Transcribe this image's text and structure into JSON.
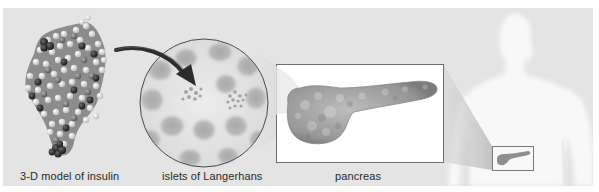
{
  "figure": {
    "labels": {
      "insulin": "3-D model of insulin",
      "islets": "islets of Langerhans",
      "pancreas": "pancreas"
    },
    "colors": {
      "background": "#e4e4e4",
      "panel_border": "#ffffff",
      "tissue": "#9a9a9a",
      "arrow": "#2e2e2e",
      "silhouette": "#f7f7f7",
      "box_border": "#7a7a7a"
    }
  }
}
